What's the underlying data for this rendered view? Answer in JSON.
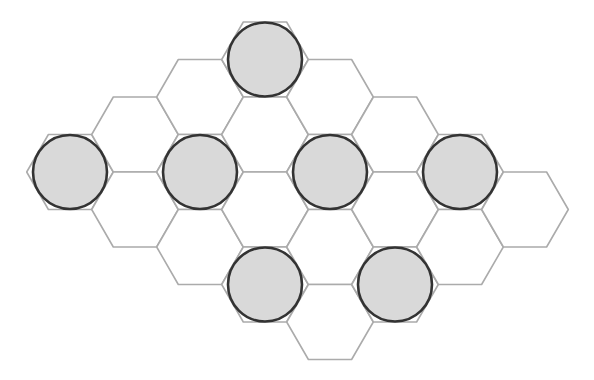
{
  "diagram": {
    "type": "hexagonal-grid",
    "orientation": "flat-top",
    "hex_side": 43.3,
    "colors": {
      "background": "#ffffff",
      "hex_stroke": "#ababab",
      "disc_fill": "#d9d9d9",
      "disc_stroke": "#333333"
    },
    "disc_radius": 37,
    "hexes": [
      {
        "x": 70,
        "y": 172,
        "disc": true
      },
      {
        "x": 135,
        "y": 134.5,
        "disc": false
      },
      {
        "x": 135,
        "y": 209.5,
        "disc": false
      },
      {
        "x": 200,
        "y": 97,
        "disc": false
      },
      {
        "x": 200,
        "y": 172,
        "disc": true
      },
      {
        "x": 200,
        "y": 247,
        "disc": false
      },
      {
        "x": 265,
        "y": 59.5,
        "disc": true
      },
      {
        "x": 265,
        "y": 134.5,
        "disc": false
      },
      {
        "x": 265,
        "y": 209.5,
        "disc": false
      },
      {
        "x": 265,
        "y": 284.5,
        "disc": true
      },
      {
        "x": 330,
        "y": 97,
        "disc": false
      },
      {
        "x": 330,
        "y": 172,
        "disc": true
      },
      {
        "x": 330,
        "y": 247,
        "disc": false
      },
      {
        "x": 330,
        "y": 322,
        "disc": false
      },
      {
        "x": 395,
        "y": 134.5,
        "disc": false
      },
      {
        "x": 395,
        "y": 209.5,
        "disc": false
      },
      {
        "x": 395,
        "y": 284.5,
        "disc": true
      },
      {
        "x": 460,
        "y": 172,
        "disc": true
      },
      {
        "x": 460,
        "y": 247,
        "disc": false
      },
      {
        "x": 525,
        "y": 209.5,
        "disc": false
      }
    ],
    "hex_count": 20,
    "disc_count": 7
  }
}
